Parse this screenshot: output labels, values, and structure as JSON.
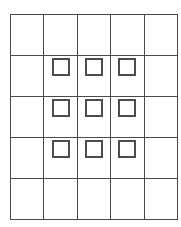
{
  "figure": {
    "title": "Grid with nine squares",
    "description": "A five by five rectangular grid. Nine small open squares are placed in the interior three by three block, at the top of each cell."
  },
  "grid": {
    "rows": 5,
    "columns": 5,
    "line_color": "#4a4a4a",
    "background_color": "#ffffff",
    "square_border_color": "#4d4d4d",
    "square_fill_color": "#ffffff",
    "square_count": 9,
    "cells": [
      [
        {
          "row": 1,
          "col": 1,
          "square": false
        },
        {
          "row": 1,
          "col": 2,
          "square": false
        },
        {
          "row": 1,
          "col": 3,
          "square": false
        },
        {
          "row": 1,
          "col": 4,
          "square": false
        },
        {
          "row": 1,
          "col": 5,
          "square": false
        }
      ],
      [
        {
          "row": 2,
          "col": 1,
          "square": false
        },
        {
          "row": 2,
          "col": 2,
          "square": true
        },
        {
          "row": 2,
          "col": 3,
          "square": true
        },
        {
          "row": 2,
          "col": 4,
          "square": true
        },
        {
          "row": 2,
          "col": 5,
          "square": false
        }
      ],
      [
        {
          "row": 3,
          "col": 1,
          "square": false
        },
        {
          "row": 3,
          "col": 2,
          "square": true
        },
        {
          "row": 3,
          "col": 3,
          "square": true
        },
        {
          "row": 3,
          "col": 4,
          "square": true
        },
        {
          "row": 3,
          "col": 5,
          "square": false
        }
      ],
      [
        {
          "row": 4,
          "col": 1,
          "square": false
        },
        {
          "row": 4,
          "col": 2,
          "square": true
        },
        {
          "row": 4,
          "col": 3,
          "square": true
        },
        {
          "row": 4,
          "col": 4,
          "square": true
        },
        {
          "row": 4,
          "col": 5,
          "square": false
        }
      ],
      [
        {
          "row": 5,
          "col": 1,
          "square": false
        },
        {
          "row": 5,
          "col": 2,
          "square": false
        },
        {
          "row": 5,
          "col": 3,
          "square": false
        },
        {
          "row": 5,
          "col": 4,
          "square": false
        },
        {
          "row": 5,
          "col": 5,
          "square": false
        }
      ]
    ]
  }
}
